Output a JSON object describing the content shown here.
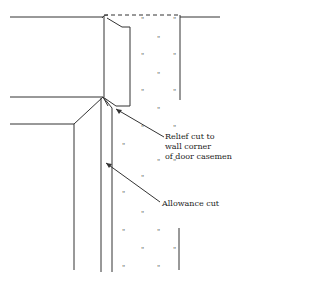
{
  "diagram": {
    "type": "technical-illustration",
    "labels": {
      "relief_cut_line1": "Relief cut to",
      "relief_cut_line2": "wall corner",
      "relief_cut_line3": "of door casement",
      "allowance_cut": "Allowance cut"
    },
    "colors": {
      "line": "#333333",
      "background": "#ffffff"
    }
  }
}
